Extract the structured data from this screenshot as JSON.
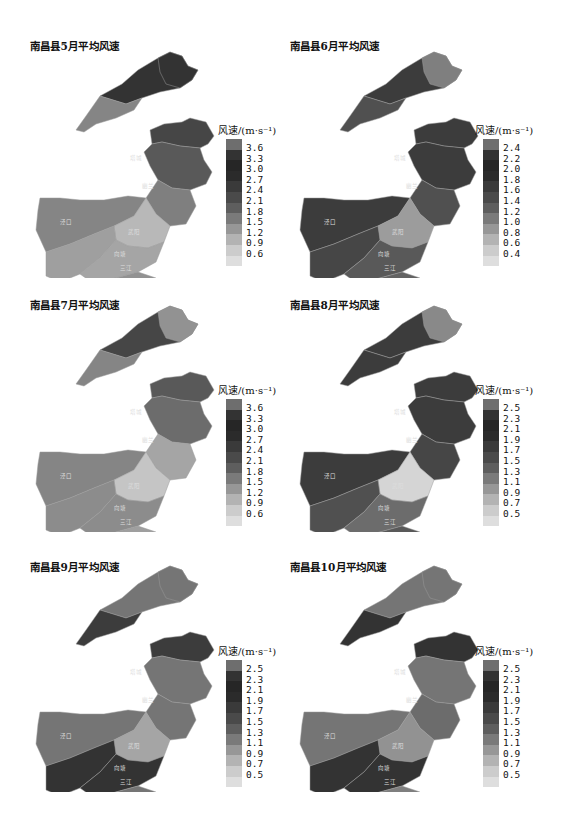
{
  "chart_data": [
    {
      "type": "heatmap",
      "subtype": "choropleth-map",
      "title": "南昌县5月平均风速",
      "legend_title": "风速/(m·s⁻¹)",
      "legend_ticks": [
        "3.6",
        "3.3",
        "3.0",
        "2.7",
        "2.4",
        "2.1",
        "1.8",
        "1.5",
        "1.2",
        "0.9",
        "0.6"
      ],
      "range": [
        0.6,
        3.6
      ],
      "regions": {
        "north_arm": 3.3,
        "north_arm_sw": 2.0,
        "east_upper": 3.0,
        "east_mid": 2.7,
        "center_east": 2.1,
        "west": 2.0,
        "center": 1.2,
        "south_west": 1.6,
        "south": 1.5,
        "south_tail": 1.8
      }
    },
    {
      "type": "heatmap",
      "subtype": "choropleth-map",
      "title": "南昌县6月平均风速",
      "legend_title": "风速/(m·s⁻¹)",
      "legend_ticks": [
        "2.4",
        "2.2",
        "2.0",
        "1.8",
        "1.6",
        "1.4",
        "1.2",
        "1.0",
        "0.8",
        "0.6",
        "0.4"
      ],
      "range": [
        0.4,
        2.4
      ],
      "regions": {
        "north_arm": 2.1,
        "north_arm_sw": 1.9,
        "north_tip": 1.4,
        "east_upper": 2.1,
        "east_mid": 2.1,
        "center_east": 1.9,
        "west": 2.1,
        "center": 1.1,
        "south_west": 2.0,
        "south": 1.8,
        "south_tail": 1.7
      }
    },
    {
      "type": "heatmap",
      "subtype": "choropleth-map",
      "title": "南昌县7月平均风速",
      "legend_title": "风速/(m·s⁻¹)",
      "legend_ticks": [
        "3.6",
        "3.3",
        "3.0",
        "2.7",
        "2.4",
        "2.1",
        "1.8",
        "1.5",
        "1.2",
        "0.9",
        "0.6"
      ],
      "range": [
        0.6,
        3.6
      ],
      "regions": {
        "north_arm": 3.0,
        "north_arm_sw": 2.0,
        "north_tip": 1.8,
        "east_upper": 2.7,
        "east_mid": 2.4,
        "center_east": 1.5,
        "west": 2.0,
        "center": 1.0,
        "south_west": 1.9,
        "south": 1.9,
        "south_tail": 1.6
      }
    },
    {
      "type": "heatmap",
      "subtype": "choropleth-map",
      "title": "南昌县8月平均风速",
      "legend_title": "风速/(m·s⁻¹)",
      "legend_ticks": [
        "2.5",
        "2.3",
        "2.1",
        "1.9",
        "1.7",
        "1.5",
        "1.3",
        "1.1",
        "0.9",
        "0.7",
        "0.5"
      ],
      "range": [
        0.5,
        2.5
      ],
      "regions": {
        "north_arm": 2.2,
        "north_arm_sw": 2.2,
        "north_tip": 1.4,
        "east_upper": 2.2,
        "east_mid": 2.2,
        "center_east": 2.1,
        "west": 2.2,
        "center": 0.6,
        "south_west": 2.0,
        "south": 1.7,
        "south_tail": 1.9
      }
    },
    {
      "type": "heatmap",
      "subtype": "choropleth-map",
      "title": "南昌县9月平均风速",
      "legend_title": "风速/(m·s⁻¹)",
      "legend_ticks": [
        "2.5",
        "2.3",
        "2.1",
        "1.9",
        "1.7",
        "1.5",
        "1.3",
        "1.1",
        "0.9",
        "0.7",
        "0.5"
      ],
      "range": [
        0.5,
        2.5
      ],
      "regions": {
        "north_arm": 1.6,
        "north_arm_sw": 2.2,
        "north_tip": 1.6,
        "east_upper": 2.2,
        "east_mid": 1.6,
        "center_east": 1.6,
        "west": 1.6,
        "center": 1.1,
        "south_west": 2.3,
        "south": 2.3,
        "south_tail": 1.6
      }
    },
    {
      "type": "heatmap",
      "subtype": "choropleth-map",
      "title": "南昌县10月平均风速",
      "legend_title": "风速/(m·s⁻¹)",
      "legend_ticks": [
        "2.5",
        "2.3",
        "2.1",
        "1.9",
        "1.7",
        "1.5",
        "1.3",
        "1.1",
        "0.9",
        "0.7",
        "0.5"
      ],
      "range": [
        0.5,
        2.5
      ],
      "regions": {
        "north_arm": 1.6,
        "north_arm_sw": 2.3,
        "north_tip": 1.6,
        "east_upper": 2.3,
        "east_mid": 1.6,
        "center_east": 1.7,
        "west": 1.6,
        "center": 1.3,
        "south_west": 2.3,
        "south": 2.3,
        "south_tail": 1.5
      }
    }
  ],
  "panels": [
    {
      "title": "南昌县5月平均风速",
      "legend_title": "风速/(m·s⁻¹)",
      "legend_ticks": [
        "3.6",
        "3.3",
        "3.0",
        "2.7",
        "2.4",
        "2.1",
        "1.8",
        "1.5",
        "1.2",
        "0.9",
        "0.6"
      ]
    },
    {
      "title": "南昌县6月平均风速",
      "legend_title": "风速/(m·s⁻¹)",
      "legend_ticks": [
        "2.4",
        "2.2",
        "2.0",
        "1.8",
        "1.6",
        "1.4",
        "1.2",
        "1.0",
        "0.8",
        "0.6",
        "0.4"
      ]
    },
    {
      "title": "南昌县7月平均风速",
      "legend_title": "风速/(m·s⁻¹)",
      "legend_ticks": [
        "3.6",
        "3.3",
        "3.0",
        "2.7",
        "2.4",
        "2.1",
        "1.8",
        "1.5",
        "1.2",
        "0.9",
        "0.6"
      ]
    },
    {
      "title": "南昌县8月平均风速",
      "legend_title": "风速/(m·s⁻¹)",
      "legend_ticks": [
        "2.5",
        "2.3",
        "2.1",
        "1.9",
        "1.7",
        "1.5",
        "1.3",
        "1.1",
        "0.9",
        "0.7",
        "0.5"
      ]
    },
    {
      "title": "南昌县9月平均风速",
      "legend_title": "风速/(m·s⁻¹)",
      "legend_ticks": [
        "2.5",
        "2.3",
        "2.1",
        "1.9",
        "1.7",
        "1.5",
        "1.3",
        "1.1",
        "0.9",
        "0.7",
        "0.5"
      ]
    },
    {
      "title": "南昌县10月平均风速",
      "legend_title": "风速/(m·s⁻¹)",
      "legend_ticks": [
        "2.5",
        "2.3",
        "2.1",
        "1.9",
        "1.7",
        "1.5",
        "1.3",
        "1.1",
        "0.9",
        "0.7",
        "0.5"
      ]
    }
  ],
  "legend_colors": [
    "#6e6e6e",
    "#333333",
    "#262626",
    "#2b2b2b",
    "#3a3a3a",
    "#4a4a4a",
    "#5e5e5e",
    "#7a7a7a",
    "#979797",
    "#b3b3b3",
    "#cccccc",
    "#dedede"
  ],
  "map_labels": [
    "幽兰",
    "武阳",
    "三江",
    "塔城",
    "泾口",
    "向塘"
  ]
}
